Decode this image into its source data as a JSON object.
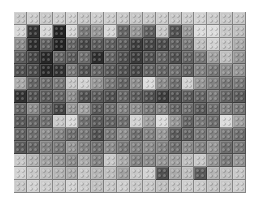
{
  "image": {
    "subject": "grayscale LEGO brick mosaic",
    "columns": 18,
    "rows": 14,
    "background": "#ffffff"
  },
  "grid": [
    [
      200,
      205,
      200,
      205,
      210,
      200,
      205,
      205,
      200,
      198,
      200,
      205,
      200,
      205,
      210,
      205,
      200,
      200
    ],
    [
      215,
      50,
      215,
      35,
      215,
      120,
      150,
      215,
      100,
      150,
      95,
      200,
      80,
      150,
      220,
      220,
      200,
      190
    ],
    [
      140,
      45,
      95,
      35,
      100,
      70,
      90,
      95,
      90,
      60,
      70,
      75,
      95,
      120,
      190,
      210,
      200,
      170
    ],
    [
      95,
      70,
      40,
      100,
      90,
      110,
      45,
      100,
      80,
      60,
      80,
      100,
      80,
      100,
      120,
      160,
      190,
      150
    ],
    [
      80,
      75,
      40,
      50,
      120,
      80,
      100,
      90,
      80,
      70,
      100,
      100,
      110,
      100,
      130,
      120,
      140,
      150
    ],
    [
      170,
      100,
      110,
      120,
      200,
      210,
      150,
      120,
      100,
      140,
      220,
      140,
      110,
      210,
      150,
      130,
      120,
      120
    ],
    [
      50,
      80,
      90,
      100,
      140,
      80,
      90,
      80,
      100,
      90,
      80,
      60,
      80,
      90,
      100,
      120,
      100,
      90
    ],
    [
      100,
      140,
      110,
      70,
      150,
      160,
      90,
      110,
      130,
      140,
      120,
      130,
      100,
      110,
      90,
      110,
      130,
      120
    ],
    [
      90,
      100,
      110,
      200,
      220,
      110,
      90,
      100,
      110,
      210,
      160,
      220,
      150,
      100,
      120,
      110,
      220,
      160
    ],
    [
      100,
      110,
      140,
      130,
      110,
      120,
      80,
      120,
      140,
      110,
      130,
      150,
      90,
      100,
      120,
      130,
      120,
      110
    ],
    [
      90,
      100,
      130,
      120,
      150,
      130,
      110,
      140,
      120,
      130,
      140,
      130,
      110,
      140,
      130,
      150,
      110,
      120
    ],
    [
      200,
      180,
      160,
      150,
      140,
      170,
      130,
      200,
      170,
      130,
      140,
      150,
      160,
      190,
      200,
      150,
      120,
      150
    ],
    [
      210,
      200,
      190,
      180,
      170,
      200,
      180,
      190,
      160,
      200,
      210,
      80,
      170,
      190,
      90,
      180,
      190,
      200
    ],
    [
      200,
      210,
      205,
      200,
      210,
      205,
      190,
      200,
      205,
      200,
      200,
      190,
      200,
      205,
      200,
      195,
      200,
      205
    ]
  ]
}
